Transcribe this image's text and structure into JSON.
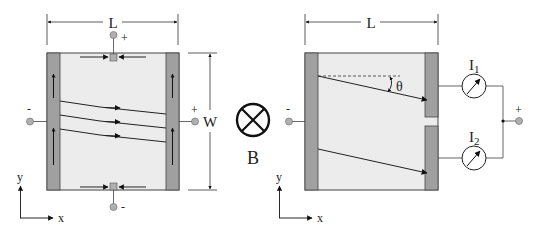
{
  "left_panel": {
    "length_label": "L",
    "width_label": "W",
    "top_terminal_sign": "+",
    "bottom_terminal_sign": "-",
    "left_terminal_sign": "-",
    "right_terminal_sign": "+",
    "axis_y_label": "y",
    "axis_x_label": "x"
  },
  "field_symbol": {
    "label": "B",
    "icon": "into-page-cross-icon"
  },
  "right_panel": {
    "length_label": "L",
    "angle_label": "θ",
    "left_terminal_sign": "-",
    "right_terminal_sign": "+",
    "meter1_label": "I",
    "meter1_sub": "1",
    "meter2_label": "I",
    "meter2_sub": "2",
    "axis_y_label": "y",
    "axis_x_label": "x"
  },
  "colors": {
    "electrode": "#a0a0a0",
    "substrate": "#ececec",
    "terminal": "#b0b0b0",
    "line": "#222222"
  }
}
